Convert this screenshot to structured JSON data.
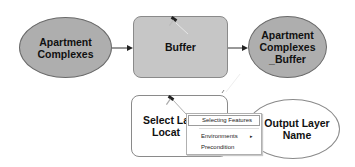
{
  "diagram": {
    "nodes": [
      {
        "id": "apartment-complexes",
        "label": "Apartment\nComplexes",
        "shape": "ellipse",
        "fill": "#aeaeae"
      },
      {
        "id": "buffer",
        "label": "Buffer",
        "shape": "rounded-rect",
        "fill": "#c6c6c6"
      },
      {
        "id": "apartment-complexes-buffer",
        "label": "Apartment\nComplexes\n_Buffer",
        "shape": "ellipse",
        "fill": "#aeaeae"
      },
      {
        "id": "select-layer-by-location",
        "label": "Select La\nLocat",
        "shape": "rounded-rect",
        "fill": "#ffffff"
      },
      {
        "id": "output-layer-name",
        "label": "Output Layer\nName",
        "shape": "ellipse",
        "fill": "#ffffff"
      }
    ],
    "edges": [
      {
        "from": "apartment-complexes",
        "to": "buffer"
      },
      {
        "from": "buffer",
        "to": "apartment-complexes-buffer"
      }
    ],
    "tool_icons": [
      "hammer-icon",
      "hammer-icon"
    ]
  },
  "context_menu": {
    "items": [
      {
        "label": "Selecting Features",
        "highlighted": true
      },
      {
        "label": "Environments",
        "submenu": true,
        "submenu_glyph": "▸"
      },
      {
        "label": "Precondition"
      }
    ]
  }
}
